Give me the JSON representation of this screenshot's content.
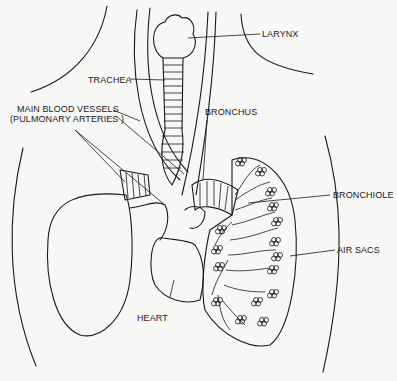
{
  "diagram": {
    "labels": {
      "larynx": "LARYNX",
      "trachea": "TRACHEA",
      "main_vessels_line1": "MAIN BLOOD VESSELS",
      "main_vessels_line2": "(PULMONARY ARTERIES )",
      "bronchus": "BRONCHUS",
      "bronchiole": "BRONCHIOLE",
      "air_sacs": "AIR SACS",
      "heart": "HEART"
    },
    "colors": {
      "ink": "#1a1a1a",
      "paper": "#f7f7f5"
    }
  }
}
